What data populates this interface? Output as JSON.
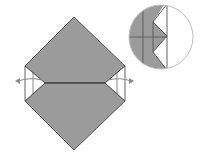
{
  "diagram": {
    "type": "origami-fold-step",
    "colors": {
      "paper_colored": "#9b9b9b",
      "paper_white": "#ffffff",
      "line": "#3a3a3a",
      "circle_outline": "#bdbdbd",
      "arrow": "#8a8a8a"
    },
    "main_model": {
      "shape": "diamond-with-side-notches",
      "arrows": [
        "left-pull-out-arrow",
        "right-pull-out-arrow"
      ]
    },
    "detail_view": {
      "shape": "magnified-circle",
      "content": "zig-zag-pleat-detail"
    }
  }
}
